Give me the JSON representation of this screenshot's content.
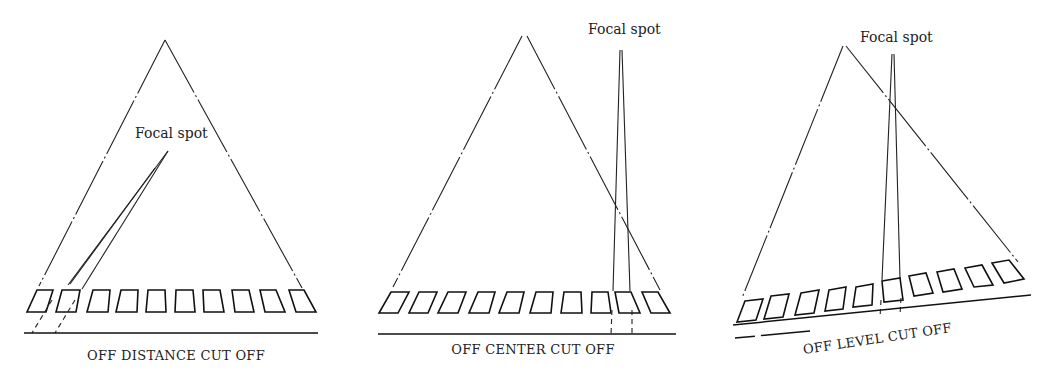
{
  "figure": {
    "panels": [
      {
        "id": "off-distance",
        "focal_spot_label": "Focal spot",
        "caption": "OFF DISTANCE CUT OFF",
        "grid_count": 10
      },
      {
        "id": "off-center",
        "focal_spot_label": "Focal spot",
        "caption": "OFF CENTER CUT OFF",
        "grid_count": 10
      },
      {
        "id": "off-level",
        "focal_spot_label": "Focal spot",
        "caption": "OFF LEVEL CUT OFF",
        "grid_count": 10
      }
    ],
    "colors": {
      "line": "#222222",
      "background": "#ffffff"
    }
  }
}
